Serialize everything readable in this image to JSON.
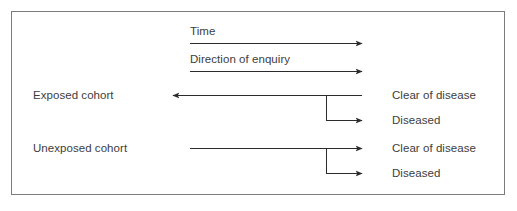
{
  "figure": {
    "type": "cohort-study-schematic",
    "background_color": "#ffffff",
    "border_color": "#7d7d7d",
    "text_color": "#3d3d3d",
    "line_color": "#2b2b2b"
  },
  "axis_labels": {
    "time": "Time",
    "direction_of_enquiry": "Direction of enquiry"
  },
  "cohorts": [
    {
      "name": "Exposed cohort",
      "arrow_direction": "left",
      "outcomes": [
        {
          "label": "Clear of disease",
          "arrow_direction": "left"
        },
        {
          "label": "Diseased",
          "arrow_direction": "right"
        }
      ]
    },
    {
      "name": "Unexposed cohort",
      "arrow_direction": "right",
      "outcomes": [
        {
          "label": "Clear of disease",
          "arrow_direction": "right"
        },
        {
          "label": "Diseased",
          "arrow_direction": "right"
        }
      ]
    }
  ]
}
